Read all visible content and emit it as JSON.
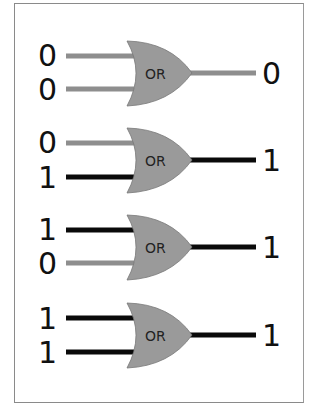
{
  "colors": {
    "gate_fill": "#9a9a9a",
    "wire_low": "#8e8e8e",
    "wire_high": "#0a0a0a",
    "frame": "#8a8a8a"
  },
  "gates": [
    {
      "label": "OR",
      "input_a": "0",
      "input_b": "0",
      "output": "0"
    },
    {
      "label": "OR",
      "input_a": "0",
      "input_b": "1",
      "output": "1"
    },
    {
      "label": "OR",
      "input_a": "1",
      "input_b": "0",
      "output": "1"
    },
    {
      "label": "OR",
      "input_a": "1",
      "input_b": "1",
      "output": "1"
    }
  ]
}
